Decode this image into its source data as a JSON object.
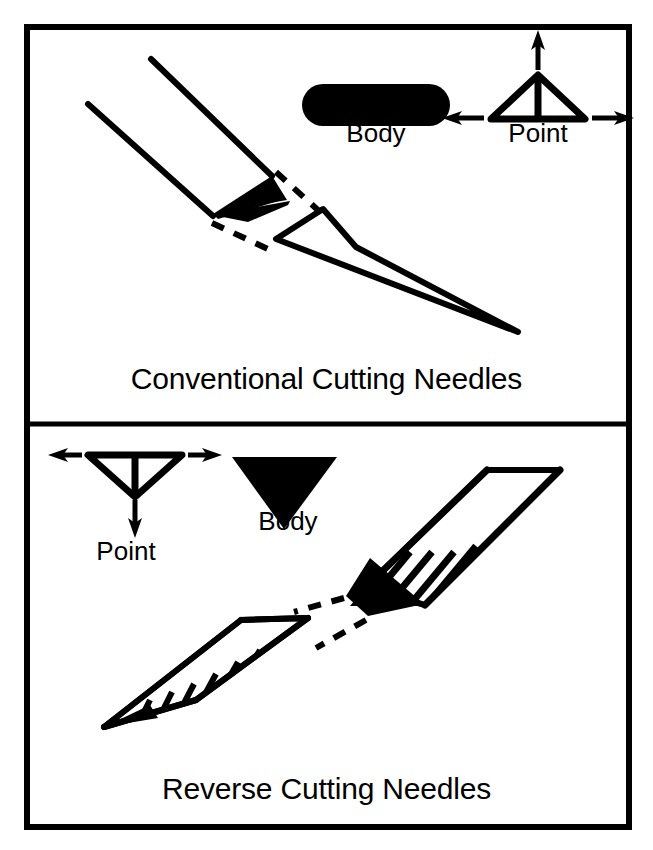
{
  "figure": {
    "border_color": "#000000",
    "ink_color": "#000000",
    "background_color": "#ffffff"
  },
  "panels": [
    {
      "id": "conventional",
      "caption": "Conventional Cutting Needles",
      "key": {
        "body": {
          "label": "Body",
          "shape": "rounded-rectangle-solid",
          "fill": "#000000"
        },
        "point": {
          "label": "Point",
          "shape": "triangle-up-outline",
          "fill": "none",
          "stroke": "#000000",
          "arrows": [
            "up",
            "left",
            "right"
          ]
        }
      },
      "needle": {
        "shaft_style": "outline",
        "cutting_edge": "triangle-solid",
        "tip_style": "outline-wedge",
        "section_line": "dashed"
      }
    },
    {
      "id": "reverse",
      "caption": "Reverse Cutting Needles",
      "key": {
        "body": {
          "label": "Body",
          "shape": "triangle-down-solid",
          "fill": "#000000"
        },
        "point": {
          "label": "Point",
          "shape": "triangle-down-outline",
          "fill": "none",
          "stroke": "#000000",
          "arrows": [
            "down",
            "left",
            "right"
          ]
        }
      },
      "needle": {
        "shaft_style": "hatched",
        "cutting_edge": "triangle-solid",
        "tip_style": "hatched-wedge",
        "section_line": "dashed"
      }
    }
  ]
}
